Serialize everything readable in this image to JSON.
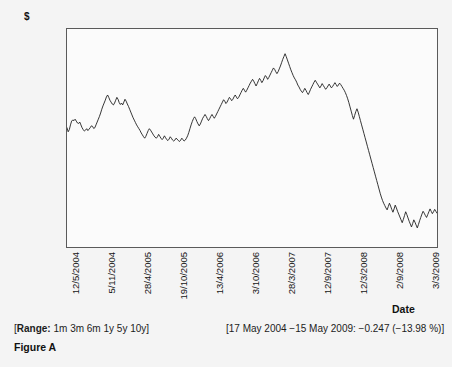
{
  "axis": {
    "y_unit": "$",
    "x_title": "Date"
  },
  "footer": {
    "range_label": "Range:",
    "range_options": "1m 3m 6m 1y 5y 10y",
    "range_open_bracket": "[",
    "range_close_bracket": "]",
    "summary": "[17 May 2004 −15 May 2009: −0.247 (−13.98 %)]",
    "caption": "Figure A"
  },
  "chart_data": {
    "type": "line",
    "title": "",
    "xlabel": "Date",
    "ylabel": "$",
    "ylim": [
      1.2975,
      2.2161
    ],
    "grid": false,
    "legend": "none",
    "line_color": "#1e1e1e",
    "ytick_labels": [
      "2.2161",
      "2.1243",
      "2.0324",
      "1.9405",
      "1.8487",
      "1.7568",
      "1.665",
      "1.5731",
      "1.4812",
      "1.3894",
      "1.2975"
    ],
    "ytick_values": [
      2.2161,
      2.1243,
      2.0324,
      1.9405,
      1.8487,
      1.7568,
      1.665,
      1.5731,
      1.4812,
      1.3894,
      1.2975
    ],
    "xtick_labels": [
      "12/5/2004",
      "5/11/2004",
      "28/4/2005",
      "19/10/2005",
      "13/4/2006",
      "3/10/2006",
      "28/3/2007",
      "12/9/2007",
      "12/3/2008",
      "2/9/2008",
      "3/3/2009"
    ],
    "xtick_positions": [
      0.0,
      0.1,
      0.2,
      0.3,
      0.4,
      0.5,
      0.6,
      0.7,
      0.8,
      0.9,
      1.0
    ],
    "series": [
      {
        "name": "$",
        "values": [
          1.8,
          1.783,
          1.792,
          1.812,
          1.828,
          1.833,
          1.83,
          1.836,
          1.828,
          1.82,
          1.818,
          1.824,
          1.812,
          1.8,
          1.792,
          1.786,
          1.79,
          1.796,
          1.788,
          1.794,
          1.8,
          1.808,
          1.806,
          1.797,
          1.8,
          1.812,
          1.824,
          1.836,
          1.848,
          1.862,
          1.878,
          1.892,
          1.904,
          1.916,
          1.93,
          1.938,
          1.928,
          1.916,
          1.908,
          1.9,
          1.896,
          1.904,
          1.916,
          1.928,
          1.92,
          1.906,
          1.898,
          1.904,
          1.896,
          1.908,
          1.92,
          1.912,
          1.9,
          1.89,
          1.878,
          1.866,
          1.854,
          1.842,
          1.832,
          1.822,
          1.812,
          1.804,
          1.796,
          1.788,
          1.778,
          1.77,
          1.762,
          1.756,
          1.764,
          1.776,
          1.788,
          1.796,
          1.79,
          1.782,
          1.774,
          1.766,
          1.76,
          1.756,
          1.762,
          1.772,
          1.764,
          1.756,
          1.75,
          1.756,
          1.766,
          1.758,
          1.75,
          1.746,
          1.752,
          1.762,
          1.756,
          1.748,
          1.744,
          1.748,
          1.756,
          1.752,
          1.746,
          1.742,
          1.748,
          1.756,
          1.75,
          1.744,
          1.748,
          1.756,
          1.766,
          1.78,
          1.796,
          1.812,
          1.826,
          1.838,
          1.846,
          1.838,
          1.826,
          1.816,
          1.808,
          1.816,
          1.828,
          1.84,
          1.848,
          1.856,
          1.848,
          1.838,
          1.83,
          1.838,
          1.848,
          1.856,
          1.848,
          1.84,
          1.848,
          1.858,
          1.868,
          1.878,
          1.888,
          1.898,
          1.908,
          1.918,
          1.912,
          1.902,
          1.908,
          1.918,
          1.928,
          1.922,
          1.914,
          1.92,
          1.93,
          1.938,
          1.93,
          1.922,
          1.928,
          1.938,
          1.948,
          1.958,
          1.966,
          1.958,
          1.95,
          1.958,
          1.968,
          1.978,
          1.988,
          1.996,
          2.004,
          1.996,
          1.986,
          1.976,
          1.986,
          1.998,
          2.008,
          2.0,
          1.99,
          1.998,
          2.01,
          2.02,
          2.014,
          2.004,
          2.012,
          2.022,
          2.032,
          2.042,
          2.052,
          2.046,
          2.036,
          2.028,
          2.036,
          2.048,
          2.06,
          2.074,
          2.088,
          2.1,
          2.112,
          2.1,
          2.086,
          2.072,
          2.058,
          2.044,
          2.032,
          2.02,
          2.01,
          2.002,
          1.992,
          1.98,
          1.972,
          1.962,
          1.954,
          1.948,
          1.956,
          1.966,
          1.958,
          1.948,
          1.94,
          1.95,
          1.962,
          1.972,
          1.982,
          1.992,
          2.0,
          1.992,
          1.984,
          1.976,
          1.968,
          1.976,
          1.986,
          1.978,
          1.97,
          1.962,
          1.968,
          1.976,
          1.984,
          1.976,
          1.968,
          1.974,
          1.982,
          1.99,
          1.982,
          1.974,
          1.98,
          1.988,
          1.982,
          1.974,
          1.966,
          1.958,
          1.948,
          1.936,
          1.922,
          1.906,
          1.888,
          1.87,
          1.852,
          1.836,
          1.852,
          1.868,
          1.88,
          1.866,
          1.848,
          1.83,
          1.812,
          1.794,
          1.776,
          1.758,
          1.74,
          1.722,
          1.704,
          1.686,
          1.668,
          1.65,
          1.632,
          1.614,
          1.596,
          1.578,
          1.56,
          1.542,
          1.524,
          1.508,
          1.494,
          1.482,
          1.472,
          1.462,
          1.454,
          1.468,
          1.482,
          1.47,
          1.456,
          1.444,
          1.458,
          1.474,
          1.462,
          1.448,
          1.436,
          1.424,
          1.412,
          1.4,
          1.414,
          1.43,
          1.446,
          1.434,
          1.42,
          1.406,
          1.394,
          1.382,
          1.396,
          1.412,
          1.402,
          1.39,
          1.378,
          1.392,
          1.408,
          1.422,
          1.436,
          1.448,
          1.44,
          1.43,
          1.422,
          1.434,
          1.446,
          1.458,
          1.448,
          1.438,
          1.446,
          1.456,
          1.448,
          1.44
        ]
      }
    ]
  }
}
